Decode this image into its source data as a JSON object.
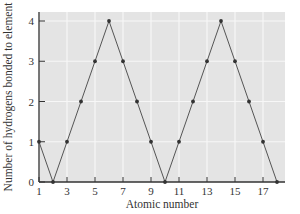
{
  "chart_data": {
    "type": "line",
    "title": "",
    "xlabel": "Atomic number",
    "ylabel": "Number of hydrogens bonded to element",
    "x": [
      1,
      2,
      3,
      4,
      5,
      6,
      7,
      8,
      9,
      10,
      11,
      12,
      13,
      14,
      15,
      16,
      17,
      18
    ],
    "series": [
      {
        "name": "Hydrogens bonded",
        "values": [
          1,
          0,
          1,
          2,
          3,
          4,
          3,
          2,
          1,
          0,
          1,
          2,
          3,
          4,
          3,
          2,
          1,
          0
        ]
      }
    ],
    "xticks": [
      1,
      3,
      5,
      7,
      9,
      11,
      13,
      15,
      17
    ],
    "yticks": [
      0,
      1,
      2,
      3,
      4
    ],
    "xlim": [
      1,
      18.5
    ],
    "ylim": [
      0,
      4.2
    ],
    "grid": true,
    "legend": "none"
  },
  "colors": {
    "plot_background": "#e4e4e4",
    "grid": "#f7f7f7",
    "line": "#555555",
    "marker": "#333333",
    "axis": "#333333"
  }
}
